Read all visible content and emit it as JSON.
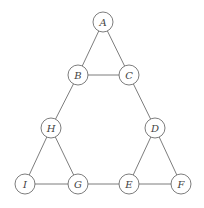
{
  "diagram": {
    "type": "graph",
    "node_radius": 10,
    "colors": {
      "stroke": "#6e6e6e",
      "label": "#444444",
      "fill": "#ffffff",
      "background": "#ffffff"
    },
    "nodes": [
      {
        "id": "A",
        "label": "A",
        "x": 103,
        "y": 22
      },
      {
        "id": "B",
        "label": "B",
        "x": 78,
        "y": 75
      },
      {
        "id": "C",
        "label": "C",
        "x": 129,
        "y": 75
      },
      {
        "id": "H",
        "label": "H",
        "x": 51,
        "y": 128
      },
      {
        "id": "D",
        "label": "D",
        "x": 155,
        "y": 128
      },
      {
        "id": "I",
        "label": "I",
        "x": 25,
        "y": 184
      },
      {
        "id": "G",
        "label": "G",
        "x": 78,
        "y": 184
      },
      {
        "id": "E",
        "label": "E",
        "x": 129,
        "y": 184
      },
      {
        "id": "F",
        "label": "F",
        "x": 181,
        "y": 184
      }
    ],
    "edges": [
      [
        "A",
        "B"
      ],
      [
        "A",
        "C"
      ],
      [
        "B",
        "C"
      ],
      [
        "B",
        "H"
      ],
      [
        "C",
        "D"
      ],
      [
        "H",
        "I"
      ],
      [
        "H",
        "G"
      ],
      [
        "I",
        "G"
      ],
      [
        "G",
        "E"
      ],
      [
        "D",
        "E"
      ],
      [
        "D",
        "F"
      ],
      [
        "E",
        "F"
      ]
    ]
  }
}
